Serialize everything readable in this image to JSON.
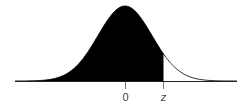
{
  "diagram": {
    "type": "normal-distribution-shaded-area",
    "shaded_region": "left tail up to z",
    "labels": {
      "mean": "0",
      "z": "z"
    },
    "colors": {
      "fill": "#000000",
      "curve": "#000000",
      "background": "#ffffff"
    }
  }
}
